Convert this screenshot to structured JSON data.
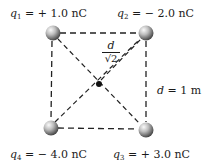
{
  "diagram": {
    "title": "",
    "charges": [
      {
        "id": "q1",
        "symbol": "q",
        "subscript": "1",
        "value_text": "= + 1.0 nC",
        "position": "top-left"
      },
      {
        "id": "q2",
        "symbol": "q",
        "subscript": "2",
        "value_text": "= − 2.0 nC",
        "position": "top-right"
      },
      {
        "id": "q3",
        "symbol": "q",
        "subscript": "3",
        "value_text": "= + 3.0 nC",
        "position": "bottom-right"
      },
      {
        "id": "q4",
        "symbol": "q",
        "subscript": "4",
        "value_text": "= − 4.0 nC",
        "position": "bottom-left"
      }
    ],
    "side_label": {
      "variable": "d",
      "value_text": "= 1 m"
    },
    "diagonal_label": {
      "numerator": "d",
      "denominator": "√2"
    },
    "center_point": "square-center-dot",
    "colors": {
      "sphere_highlight": "#f4f4f4",
      "sphere_shadow": "#5a5a5a",
      "line": "#222222",
      "text": "#1a1a1a"
    }
  }
}
